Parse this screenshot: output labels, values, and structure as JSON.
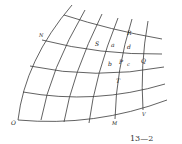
{
  "figure": {
    "number": "13—2",
    "type": "curvilinear coordinate grid"
  },
  "labels": {
    "N": "N",
    "S": "S",
    "a": "a",
    "R": "R",
    "d": "d",
    "b": "b",
    "P": "P",
    "c": "c",
    "Q": "Q",
    "T": "T",
    "O": "O",
    "M": "M",
    "V": "V"
  }
}
